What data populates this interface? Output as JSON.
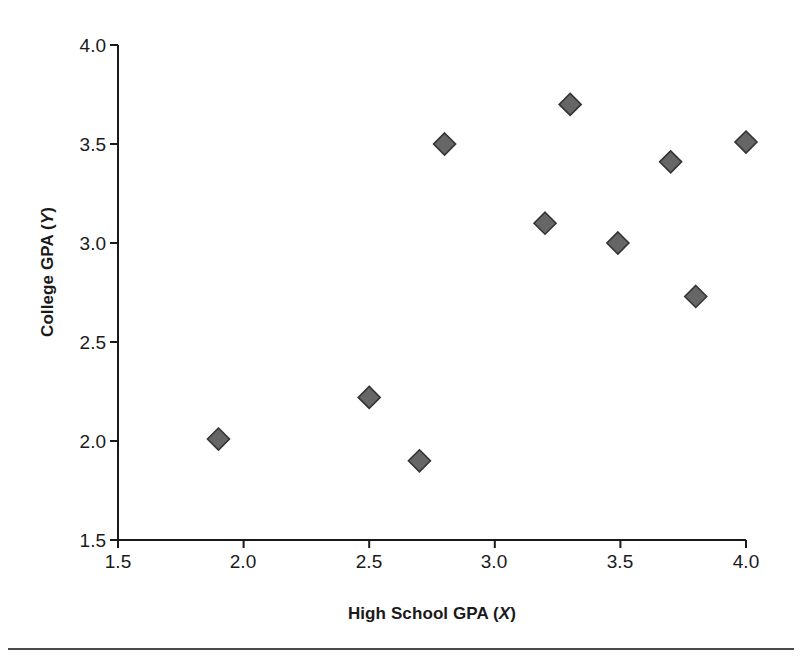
{
  "chart_data": {
    "type": "scatter",
    "title": "",
    "xlabel": "High School GPA (X)",
    "xlabel_main": "High School GPA (",
    "xlabel_var": "X",
    "xlabel_tail": ")",
    "ylabel": "College GPA (Y)",
    "ylabel_main": "College GPA (",
    "ylabel_var": "Y",
    "ylabel_tail": ")",
    "xlim": [
      1.5,
      4.0
    ],
    "ylim": [
      1.5,
      4.0
    ],
    "xticks": [
      "1.5",
      "2.0",
      "2.5",
      "3.0",
      "3.5",
      "4.0"
    ],
    "yticks": [
      "1.5",
      "2.0",
      "2.5",
      "3.0",
      "3.5",
      "4.0"
    ],
    "xtick_values": [
      1.5,
      2.0,
      2.5,
      3.0,
      3.5,
      4.0
    ],
    "ytick_values": [
      1.5,
      2.0,
      2.5,
      3.0,
      3.5,
      4.0
    ],
    "grid": false,
    "legend": false,
    "marker": "diamond",
    "marker_color": "#666666",
    "marker_edge_color": "#333333",
    "axis_color": "#1a1a1a",
    "background": "#ffffff",
    "x": [
      1.9,
      2.5,
      2.7,
      2.8,
      3.2,
      3.3,
      3.49,
      3.7,
      3.8,
      4.0
    ],
    "y": [
      2.01,
      2.22,
      1.9,
      3.5,
      3.1,
      3.7,
      3.0,
      3.41,
      2.73,
      3.51
    ],
    "points": [
      {
        "x": 1.9,
        "y": 2.01
      },
      {
        "x": 2.5,
        "y": 2.22
      },
      {
        "x": 2.7,
        "y": 1.9
      },
      {
        "x": 2.8,
        "y": 3.5
      },
      {
        "x": 3.2,
        "y": 3.1
      },
      {
        "x": 3.3,
        "y": 3.7
      },
      {
        "x": 3.49,
        "y": 3.0
      },
      {
        "x": 3.7,
        "y": 3.41
      },
      {
        "x": 3.8,
        "y": 2.73
      },
      {
        "x": 4.0,
        "y": 3.51
      }
    ]
  },
  "figure": {
    "has_bottom_rule": true
  }
}
